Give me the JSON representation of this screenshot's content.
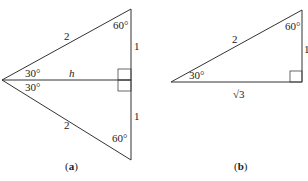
{
  "figure_a": {
    "caption_open": "(",
    "caption_letter": "a",
    "caption_close": ")",
    "hyp_top": "2",
    "hyp_bottom": "2",
    "side_top": "1",
    "side_bottom": "1",
    "height_label": "h",
    "angle_top_left": "30°",
    "angle_bottom_left": "30°",
    "angle_top_right": "60°",
    "angle_bottom_right": "60°"
  },
  "figure_b": {
    "caption_open": "(",
    "caption_letter": "b",
    "caption_close": ")",
    "hypotenuse": "2",
    "vertical_side": "1",
    "base": "√3",
    "angle_left": "30°",
    "angle_top": "60°"
  },
  "colors": {
    "line": "#333333",
    "text": "#222222",
    "background": "#ffffff"
  }
}
